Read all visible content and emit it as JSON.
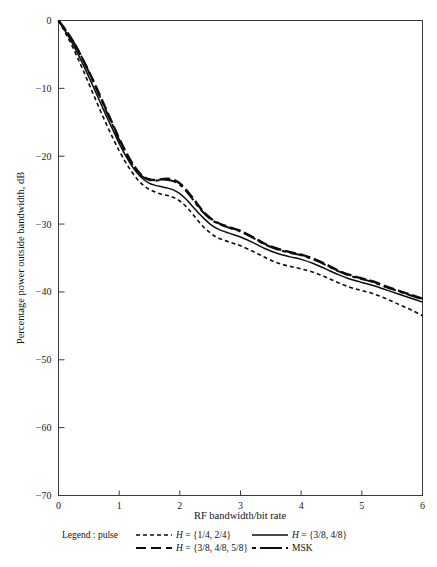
{
  "figure": {
    "background_color": "#ffffff",
    "line_color": "#0d0d0d",
    "axis_color": "#3a3a3a"
  },
  "axes": {
    "x_title": "RF bandwidth/bit rate",
    "y_title": "Percentage power outside bandwidth, dB",
    "x_ticks": [
      "0",
      "1",
      "2",
      "3",
      "4",
      "5",
      "6"
    ],
    "y_ticks": [
      "0",
      "−10",
      "−20",
      "−30",
      "−40",
      "−50",
      "−60",
      "−70"
    ]
  },
  "legend": {
    "prefix": "Legend : pulse",
    "entries": [
      {
        "style": "short-dash",
        "label_math": "H",
        "label_rest": " = {1/4, 2/4}"
      },
      {
        "style": "solid",
        "label_math": "H",
        "label_rest": " = {3/8, 4/8}"
      },
      {
        "style": "long-dash",
        "label_math": "H",
        "label_rest": " = {3/8, 4/8, 5/8}"
      },
      {
        "style": "dash-dot",
        "label_math": "",
        "label_rest": "MSK"
      }
    ]
  },
  "chart_data": {
    "type": "line",
    "title": "",
    "xlabel": "RF bandwidth/bit rate",
    "ylabel": "Percentage power outside bandwidth, dB",
    "xlim": [
      0,
      6
    ],
    "ylim": [
      -70,
      0
    ],
    "xticks": [
      0,
      1,
      2,
      3,
      4,
      5,
      6
    ],
    "yticks": [
      0,
      -10,
      -20,
      -30,
      -40,
      -50,
      -60,
      -70
    ],
    "grid": false,
    "legend_position": "below-axes",
    "series": [
      {
        "name": "H = {1/4, 2/4}",
        "style": "short-dash",
        "x": [
          0.0,
          0.1,
          0.2,
          0.3,
          0.4,
          0.5,
          0.6,
          0.7,
          0.8,
          0.9,
          1.0,
          1.1,
          1.2,
          1.3,
          1.4,
          1.5,
          1.6,
          1.7,
          1.8,
          1.9,
          2.0,
          2.1,
          2.2,
          2.3,
          2.4,
          2.5,
          2.6,
          2.7,
          2.8,
          2.9,
          3.0,
          3.2,
          3.4,
          3.6,
          3.8,
          4.0,
          4.2,
          4.4,
          4.6,
          4.8,
          5.0,
          5.2,
          5.4,
          5.6,
          5.8,
          6.0
        ],
        "y": [
          0.0,
          -1.6,
          -3.3,
          -5.2,
          -7.2,
          -9.3,
          -11.4,
          -13.5,
          -15.5,
          -17.4,
          -19.2,
          -20.8,
          -22.2,
          -23.4,
          -24.3,
          -24.9,
          -25.3,
          -25.6,
          -25.8,
          -26.1,
          -26.6,
          -27.4,
          -28.4,
          -29.5,
          -30.5,
          -31.3,
          -31.9,
          -32.3,
          -32.6,
          -32.9,
          -33.2,
          -34.0,
          -34.9,
          -35.7,
          -36.2,
          -36.6,
          -37.1,
          -37.8,
          -38.6,
          -39.3,
          -39.8,
          -40.3,
          -41.0,
          -41.8,
          -42.6,
          -43.5
        ]
      },
      {
        "name": "H = {3/8, 4/8}",
        "style": "solid",
        "x": [
          0.0,
          0.1,
          0.2,
          0.3,
          0.4,
          0.5,
          0.6,
          0.7,
          0.8,
          0.9,
          1.0,
          1.1,
          1.2,
          1.3,
          1.4,
          1.5,
          1.6,
          1.7,
          1.8,
          1.9,
          2.0,
          2.1,
          2.2,
          2.3,
          2.4,
          2.5,
          2.6,
          2.7,
          2.8,
          2.9,
          3.0,
          3.2,
          3.4,
          3.6,
          3.8,
          4.0,
          4.2,
          4.4,
          4.6,
          4.8,
          5.0,
          5.2,
          5.4,
          5.6,
          5.8,
          6.0
        ],
        "y": [
          0.0,
          -1.4,
          -2.9,
          -4.6,
          -6.4,
          -8.3,
          -10.3,
          -12.3,
          -14.3,
          -16.2,
          -18.1,
          -19.8,
          -21.3,
          -22.5,
          -23.4,
          -24.0,
          -24.3,
          -24.5,
          -24.7,
          -25.0,
          -25.5,
          -26.3,
          -27.3,
          -28.3,
          -29.2,
          -30.0,
          -30.6,
          -31.0,
          -31.3,
          -31.6,
          -31.9,
          -32.7,
          -33.6,
          -34.3,
          -34.8,
          -35.2,
          -35.8,
          -36.6,
          -37.4,
          -38.1,
          -38.6,
          -39.1,
          -39.7,
          -40.3,
          -40.9,
          -41.5
        ]
      },
      {
        "name": "H = {3/8, 4/8, 5/8}",
        "style": "long-dash",
        "x": [
          0.0,
          0.1,
          0.2,
          0.3,
          0.4,
          0.5,
          0.6,
          0.7,
          0.8,
          0.9,
          1.0,
          1.1,
          1.2,
          1.3,
          1.4,
          1.5,
          1.6,
          1.7,
          1.8,
          1.9,
          2.0,
          2.1,
          2.2,
          2.3,
          2.4,
          2.5,
          2.6,
          2.7,
          2.8,
          2.9,
          3.0,
          3.2,
          3.4,
          3.6,
          3.8,
          4.0,
          4.2,
          4.4,
          4.6,
          4.8,
          5.0,
          5.2,
          5.4,
          5.6,
          5.8,
          6.0
        ],
        "y": [
          0.0,
          -1.2,
          -2.5,
          -4.0,
          -5.7,
          -7.5,
          -9.4,
          -11.4,
          -13.4,
          -15.4,
          -17.4,
          -19.2,
          -20.8,
          -22.1,
          -23.0,
          -23.4,
          -23.5,
          -23.4,
          -23.3,
          -23.5,
          -24.0,
          -24.9,
          -26.0,
          -27.2,
          -28.3,
          -29.1,
          -29.7,
          -30.1,
          -30.4,
          -30.7,
          -31.0,
          -31.9,
          -32.9,
          -33.6,
          -34.1,
          -34.5,
          -35.1,
          -35.9,
          -36.8,
          -37.5,
          -38.0,
          -38.5,
          -39.2,
          -39.8,
          -40.4,
          -41.0
        ]
      },
      {
        "name": "MSK",
        "style": "dash-dot",
        "x": [
          0.0,
          0.1,
          0.2,
          0.3,
          0.4,
          0.5,
          0.6,
          0.7,
          0.8,
          0.9,
          1.0,
          1.1,
          1.2,
          1.3,
          1.4,
          1.5,
          1.6,
          1.7,
          1.8,
          1.9,
          2.0,
          2.1,
          2.2,
          2.3,
          2.4,
          2.5,
          2.6,
          2.7,
          2.8,
          2.9,
          3.0,
          3.2,
          3.4,
          3.6,
          3.8,
          4.0,
          4.2,
          4.4,
          4.6,
          4.8,
          5.0,
          5.2,
          5.4,
          5.6,
          5.8,
          6.0
        ],
        "y": [
          0.0,
          -1.2,
          -2.5,
          -4.0,
          -5.7,
          -7.6,
          -9.6,
          -11.6,
          -13.6,
          -15.6,
          -17.6,
          -19.4,
          -21.0,
          -22.3,
          -23.1,
          -23.5,
          -23.6,
          -23.5,
          -23.5,
          -23.7,
          -24.2,
          -25.1,
          -26.2,
          -27.4,
          -28.4,
          -29.2,
          -29.8,
          -30.2,
          -30.5,
          -30.8,
          -31.1,
          -32.0,
          -33.0,
          -33.7,
          -34.2,
          -34.6,
          -35.2,
          -36.0,
          -36.9,
          -37.6,
          -38.1,
          -38.6,
          -39.3,
          -39.9,
          -40.5,
          -41.1
        ]
      }
    ]
  }
}
